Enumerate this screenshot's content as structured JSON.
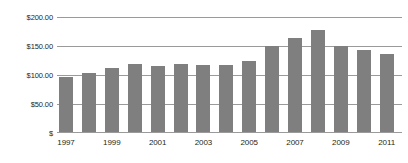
{
  "chart_data": {
    "type": "bar",
    "title": "",
    "subtitle": "",
    "xlabel": "",
    "ylabel": "",
    "categories": [
      "1997",
      "1998",
      "1999",
      "2000",
      "2001",
      "2002",
      "2003",
      "2004",
      "2005",
      "2006",
      "2007",
      "2008",
      "2009",
      "2010",
      "2011"
    ],
    "values": [
      96,
      103,
      112,
      119,
      116,
      119,
      118,
      118,
      124,
      150,
      164,
      178,
      150,
      143,
      136
    ],
    "series": [
      {
        "name": "",
        "values": [
          96,
          103,
          112,
          119,
          116,
          119,
          118,
          118,
          124,
          150,
          164,
          178,
          150,
          143,
          136
        ]
      }
    ],
    "ylim": [
      0,
      200
    ],
    "y_ticks": [
      0,
      50,
      100,
      150,
      200
    ],
    "y_tick_labels": [
      "$",
      "$50.00",
      "$100.00",
      "$150.00",
      "$200.00"
    ],
    "x_tick_labels": [
      "1997",
      "1999",
      "2001",
      "2003",
      "2005",
      "2007",
      "2009",
      "2011"
    ],
    "x_tick_categories": [
      "1997",
      "1999",
      "2001",
      "2003",
      "2005",
      "2007",
      "2009",
      "2011"
    ],
    "grid": true,
    "legend": false,
    "legend_position": "none",
    "bar_color": "#7f7f7f",
    "grid_color": "#9a9a9a",
    "text_color": "#231f20",
    "background_color": "#ffffff"
  }
}
